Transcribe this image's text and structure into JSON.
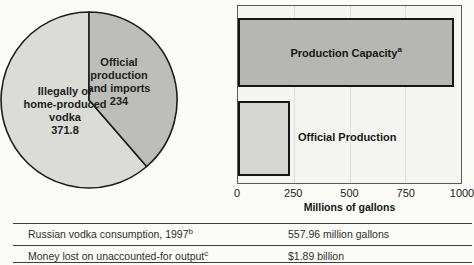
{
  "pie": {
    "official": {
      "line1": "Official",
      "line2": "production",
      "line3": "and imports",
      "value": "234"
    },
    "illegal": {
      "line1": "Illegally or",
      "line2": "home-produced",
      "line3": "vodka",
      "value": "371.8"
    }
  },
  "bar": {
    "capacity_label": "Production Capacity",
    "capacity_marker": "a",
    "official_label": "Official Production",
    "xlabel": "Millions of gallons",
    "ticks": [
      "0",
      "250",
      "500",
      "750",
      "1000"
    ]
  },
  "table": {
    "rows": [
      {
        "label": "Russian vodka consumption, 1997",
        "marker": "b",
        "value": "557.96 million gallons"
      },
      {
        "label": "Money lost on unaccounted-for output",
        "marker": "c",
        "value": "$1.89 billion"
      }
    ]
  },
  "colors": {
    "pie_light_slice": "#dbdbd8",
    "pie_dark_slice": "#bdbdba",
    "bar_capacity_fill": "#b6b6b3",
    "bar_official_fill": "#d5d5d2",
    "plot_background": "#f4f4f1",
    "outline": "#1c1c1c"
  },
  "chart_data": [
    {
      "type": "pie",
      "labels": [
        "Illegally or home-produced vodka",
        "Official production and imports"
      ],
      "values": [
        371.8,
        234
      ],
      "units": "millions of gallons",
      "legend_position": "inside"
    },
    {
      "type": "bar",
      "orientation": "horizontal",
      "categories": [
        "Production Capacity",
        "Official Production"
      ],
      "values": [
        970,
        234
      ],
      "footnote_markers": [
        "a",
        ""
      ],
      "xlabel": "Millions of gallons",
      "xlim": [
        0,
        1000
      ],
      "xticks": [
        0,
        250,
        500,
        750,
        1000
      ],
      "grid": true
    },
    {
      "type": "table",
      "rows": [
        [
          "Russian vodka consumption, 1997 [b]",
          "557.96 million gallons"
        ],
        [
          "Money lost on unaccounted-for output [c]",
          "$1.89 billion"
        ]
      ]
    }
  ]
}
